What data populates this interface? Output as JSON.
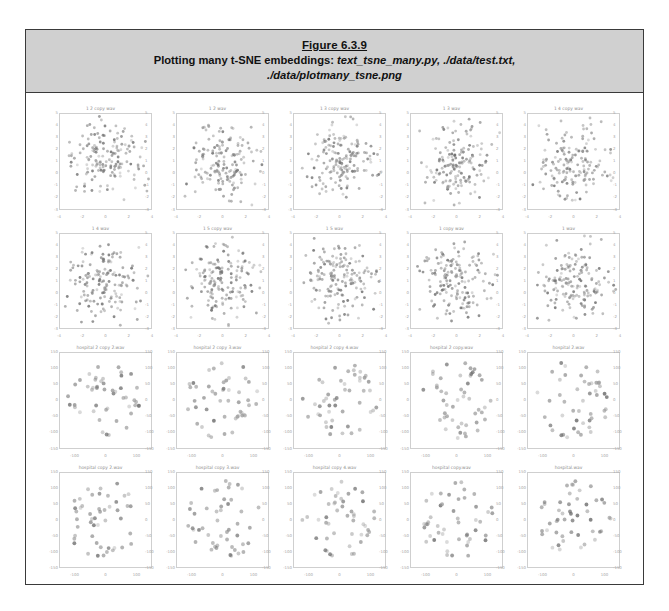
{
  "figure": {
    "number": "Figure 6.3.9",
    "caption_prefix": "Plotting many t-SNE embeddings:",
    "caption_files_line1": "text_tsne_many.py, ./data/test.txt,",
    "caption_files_line2": "./data/plotmany_tsne.png"
  },
  "colors": {
    "caption_background": "#d0d0d0",
    "frame_border": "#3a3a3a",
    "axis_line": "#cfcfcf",
    "tick_label": "#a5a5a5",
    "title_label": "#8d8d8d",
    "point_fill": "#9a9a9a",
    "point_fill_dark": "#6f6f6f"
  },
  "chart_data": {
    "type": "scatter",
    "title": "Plotting many t-SNE embeddings",
    "grid_rows": 4,
    "grid_cols": 5,
    "xlabel": "",
    "ylabel": "",
    "grid": false,
    "legend": "none",
    "panels": [
      {
        "row": 1,
        "col": 1,
        "title": "1 2 copy wav",
        "xlim": [
          -4,
          4
        ],
        "ylim": [
          -3,
          5
        ],
        "xticks": [
          -4,
          -2,
          0,
          2,
          4
        ],
        "yticks": [
          -3,
          -2,
          -1,
          0,
          1,
          2,
          3,
          4,
          5
        ],
        "n_points": 160,
        "point_size": 1.6,
        "seed": 11
      },
      {
        "row": 1,
        "col": 2,
        "title": "1 2 wav",
        "xlim": [
          -4,
          4
        ],
        "ylim": [
          -3,
          5
        ],
        "xticks": [
          -4,
          -2,
          0,
          2,
          4
        ],
        "yticks": [
          -3,
          -2,
          -1,
          0,
          1,
          2,
          3,
          4,
          5
        ],
        "n_points": 160,
        "point_size": 1.6,
        "seed": 12
      },
      {
        "row": 1,
        "col": 3,
        "title": "1 3 copy wav",
        "xlim": [
          -4,
          4
        ],
        "ylim": [
          -3,
          5
        ],
        "xticks": [
          -4,
          -2,
          0,
          2,
          4
        ],
        "yticks": [
          -3,
          -2,
          -1,
          0,
          1,
          2,
          3,
          4,
          5
        ],
        "n_points": 160,
        "point_size": 1.6,
        "seed": 13
      },
      {
        "row": 1,
        "col": 4,
        "title": "1 3 wav",
        "xlim": [
          -4,
          4
        ],
        "ylim": [
          -3,
          5
        ],
        "xticks": [
          -4,
          -2,
          0,
          2,
          4
        ],
        "yticks": [
          -3,
          -2,
          -1,
          0,
          1,
          2,
          3,
          4,
          5
        ],
        "n_points": 160,
        "point_size": 1.6,
        "seed": 14
      },
      {
        "row": 1,
        "col": 5,
        "title": "1 4 copy wav",
        "xlim": [
          -4,
          4
        ],
        "ylim": [
          -3,
          5
        ],
        "xticks": [
          -4,
          -2,
          0,
          2,
          4
        ],
        "yticks": [
          -3,
          -2,
          -1,
          0,
          1,
          2,
          3,
          4,
          5
        ],
        "n_points": 160,
        "point_size": 1.6,
        "seed": 15
      },
      {
        "row": 2,
        "col": 1,
        "title": "1 4 wav",
        "xlim": [
          -4,
          4
        ],
        "ylim": [
          -3,
          5
        ],
        "xticks": [
          -4,
          -2,
          0,
          2,
          4
        ],
        "yticks": [
          -3,
          -2,
          -1,
          0,
          1,
          2,
          3,
          4,
          5
        ],
        "n_points": 160,
        "point_size": 1.6,
        "seed": 21
      },
      {
        "row": 2,
        "col": 2,
        "title": "1 5 copy wav",
        "xlim": [
          -4,
          4
        ],
        "ylim": [
          -3,
          5
        ],
        "xticks": [
          -4,
          -2,
          0,
          2,
          4
        ],
        "yticks": [
          -3,
          -2,
          -1,
          0,
          1,
          2,
          3,
          4,
          5
        ],
        "n_points": 160,
        "point_size": 1.6,
        "seed": 22
      },
      {
        "row": 2,
        "col": 3,
        "title": "1 5 wav",
        "xlim": [
          -4,
          4
        ],
        "ylim": [
          -3,
          5
        ],
        "xticks": [
          -4,
          -2,
          0,
          2,
          4
        ],
        "yticks": [
          -3,
          -2,
          -1,
          0,
          1,
          2,
          3,
          4,
          5
        ],
        "n_points": 160,
        "point_size": 1.6,
        "seed": 23
      },
      {
        "row": 2,
        "col": 4,
        "title": "1 copy wav",
        "xlim": [
          -4,
          4
        ],
        "ylim": [
          -3,
          5
        ],
        "xticks": [
          -4,
          -2,
          0,
          2,
          4
        ],
        "yticks": [
          -3,
          -2,
          -1,
          0,
          1,
          2,
          3,
          4,
          5
        ],
        "n_points": 160,
        "point_size": 1.6,
        "seed": 24
      },
      {
        "row": 2,
        "col": 5,
        "title": "1 wav",
        "xlim": [
          -4,
          4
        ],
        "ylim": [
          -3,
          5
        ],
        "xticks": [
          -4,
          -2,
          0,
          2,
          4
        ],
        "yticks": [
          -3,
          -2,
          -1,
          0,
          1,
          2,
          3,
          4,
          5
        ],
        "n_points": 160,
        "point_size": 1.6,
        "seed": 25
      },
      {
        "row": 3,
        "col": 1,
        "title": "hospital 2 copy 2.wav",
        "xlim": [
          -150,
          150
        ],
        "ylim": [
          -150,
          150
        ],
        "xticks": [
          -100,
          0,
          100
        ],
        "yticks": [
          -150,
          -100,
          -50,
          0,
          50,
          100,
          150
        ],
        "n_points": 48,
        "point_size": 2.3,
        "seed": 31
      },
      {
        "row": 3,
        "col": 2,
        "title": "hospital 2 copy 3.wav",
        "xlim": [
          -150,
          150
        ],
        "ylim": [
          -150,
          150
        ],
        "xticks": [
          -100,
          0,
          100
        ],
        "yticks": [
          -150,
          -100,
          -50,
          0,
          50,
          100,
          150
        ],
        "n_points": 48,
        "point_size": 2.3,
        "seed": 32
      },
      {
        "row": 3,
        "col": 3,
        "title": "hospital 2 copy 4.wav",
        "xlim": [
          -150,
          150
        ],
        "ylim": [
          -150,
          150
        ],
        "xticks": [
          -100,
          0,
          100
        ],
        "yticks": [
          -150,
          -100,
          -50,
          0,
          50,
          100,
          150
        ],
        "n_points": 48,
        "point_size": 2.3,
        "seed": 33
      },
      {
        "row": 3,
        "col": 4,
        "title": "hospital 2 copy.wav",
        "xlim": [
          -150,
          150
        ],
        "ylim": [
          -150,
          150
        ],
        "xticks": [
          -100,
          0,
          100
        ],
        "yticks": [
          -150,
          -100,
          -50,
          0,
          50,
          100,
          150
        ],
        "n_points": 48,
        "point_size": 2.3,
        "seed": 34
      },
      {
        "row": 3,
        "col": 5,
        "title": "hospital 2.wav",
        "xlim": [
          -150,
          150
        ],
        "ylim": [
          -150,
          150
        ],
        "xticks": [
          -100,
          0,
          100
        ],
        "yticks": [
          -150,
          -100,
          -50,
          0,
          50,
          100,
          150
        ],
        "n_points": 48,
        "point_size": 2.3,
        "seed": 35
      },
      {
        "row": 4,
        "col": 1,
        "title": "hospital copy 2.wav",
        "xlim": [
          -150,
          150
        ],
        "ylim": [
          -150,
          150
        ],
        "xticks": [
          -100,
          0,
          100
        ],
        "yticks": [
          -150,
          -100,
          -50,
          0,
          50,
          100,
          150
        ],
        "n_points": 48,
        "point_size": 2.3,
        "seed": 41
      },
      {
        "row": 4,
        "col": 2,
        "title": "hospital copy 3.wav",
        "xlim": [
          -150,
          150
        ],
        "ylim": [
          -150,
          150
        ],
        "xticks": [
          -100,
          0,
          100
        ],
        "yticks": [
          -150,
          -100,
          -50,
          0,
          50,
          100,
          150
        ],
        "n_points": 48,
        "point_size": 2.3,
        "seed": 42
      },
      {
        "row": 4,
        "col": 3,
        "title": "hospital copy 4.wav",
        "xlim": [
          -150,
          150
        ],
        "ylim": [
          -150,
          150
        ],
        "xticks": [
          -100,
          0,
          100
        ],
        "yticks": [
          -150,
          -100,
          -50,
          0,
          50,
          100,
          150
        ],
        "n_points": 48,
        "point_size": 2.3,
        "seed": 43
      },
      {
        "row": 4,
        "col": 4,
        "title": "hospital copy.wav",
        "xlim": [
          -150,
          150
        ],
        "ylim": [
          -150,
          150
        ],
        "xticks": [
          -100,
          0,
          100
        ],
        "yticks": [
          -150,
          -100,
          -50,
          0,
          50,
          100,
          150
        ],
        "n_points": 48,
        "point_size": 2.3,
        "seed": 44
      },
      {
        "row": 4,
        "col": 5,
        "title": "hospital.wav",
        "xlim": [
          -150,
          150
        ],
        "ylim": [
          -150,
          150
        ],
        "xticks": [
          -100,
          0,
          100
        ],
        "yticks": [
          -150,
          -100,
          -50,
          0,
          50,
          100,
          150
        ],
        "n_points": 48,
        "point_size": 2.3,
        "seed": 45
      }
    ]
  }
}
